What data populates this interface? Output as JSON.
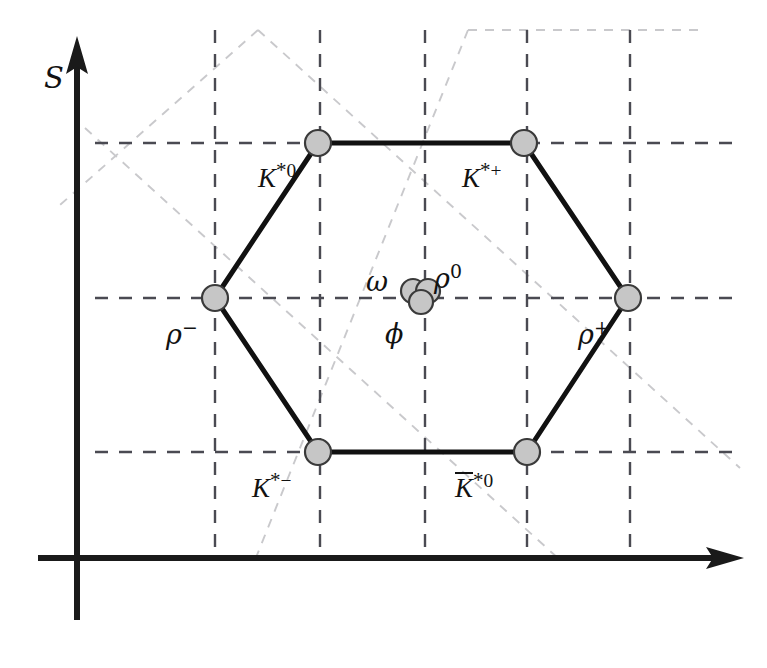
{
  "figure": {
    "background_color": "#ffffff",
    "width": 767,
    "height": 668
  },
  "axes": {
    "vertical": {
      "label": "S",
      "label_meaning": "strangeness",
      "x": 77,
      "y_top": 42,
      "y_bottom": 620,
      "color": "#1a1a1a",
      "label_x": 44,
      "label_y": 74
    },
    "horizontal": {
      "label": "",
      "y": 558,
      "x_left": 38,
      "x_right": 740,
      "color": "#1a1a1a"
    }
  },
  "grid": {
    "color": "#4a4a52",
    "diagonal_color": "#c9c9cc",
    "vertical_lines_x": [
      215,
      320,
      425,
      527,
      630
    ],
    "horizontal_lines_y": [
      143,
      298,
      452
    ],
    "vertical_span": [
      30,
      548
    ],
    "horizontal_span": [
      95,
      740
    ]
  },
  "nodes": [
    {
      "id": "Kstar0",
      "label": "K*0",
      "base": "K",
      "star": "*",
      "sup": "0",
      "overbar": false,
      "cx": 318,
      "cy": 143,
      "r": 13,
      "label_x": 258,
      "label_y": 160
    },
    {
      "id": "Kstarplus",
      "label": "K*+",
      "base": "K",
      "star": "*",
      "sup": "+",
      "overbar": false,
      "cx": 524,
      "cy": 143,
      "r": 13,
      "label_x": 462,
      "label_y": 160
    },
    {
      "id": "rhoplus",
      "label": "rho+",
      "base": "ρ",
      "star": "",
      "sup": "+",
      "overbar": false,
      "cx": 628,
      "cy": 298,
      "r": 13,
      "label_x": 578,
      "label_y": 318
    },
    {
      "id": "Kbarstar0",
      "label": "K̄*0",
      "base": "K",
      "star": "*",
      "sup": "0",
      "overbar": true,
      "cx": 527,
      "cy": 452,
      "r": 13,
      "label_x": 455,
      "label_y": 470
    },
    {
      "id": "Kstarminus",
      "label": "K*-",
      "base": "K",
      "star": "*",
      "sup": "−",
      "overbar": false,
      "cx": 318,
      "cy": 452,
      "r": 13,
      "label_x": 252,
      "label_y": 470
    },
    {
      "id": "rhominus",
      "label": "rho-",
      "base": "ρ",
      "star": "",
      "sup": "−",
      "overbar": false,
      "cx": 215,
      "cy": 298,
      "r": 13,
      "label_x": 166,
      "label_y": 318
    }
  ],
  "center_nodes": [
    {
      "id": "omega",
      "label": "ω",
      "sup": "",
      "cx": 413,
      "cy": 291,
      "r": 12,
      "label_x": 366,
      "label_y": 268
    },
    {
      "id": "rho0",
      "label": "ρ",
      "sup": "0",
      "cx": 428,
      "cy": 291,
      "r": 12,
      "label_x": 434,
      "label_y": 262
    },
    {
      "id": "phi",
      "label": "ϕ",
      "sup": "",
      "cx": 421,
      "cy": 302,
      "r": 12,
      "label_x": 385,
      "label_y": 320
    }
  ],
  "hexagon_edges": [
    {
      "from": "Kstar0",
      "to": "Kstarplus"
    },
    {
      "from": "Kstarplus",
      "to": "rhoplus"
    },
    {
      "from": "rhoplus",
      "to": "Kbarstar0"
    },
    {
      "from": "Kbarstar0",
      "to": "Kstarminus"
    },
    {
      "from": "Kstarminus",
      "to": "rhominus"
    },
    {
      "from": "rhominus",
      "to": "Kstar0"
    }
  ],
  "diagonal_guides": [
    {
      "x1": 85,
      "y1": 128,
      "x2": 560,
      "y2": 560
    },
    {
      "x1": 258,
      "y1": 30,
      "x2": 740,
      "y2": 468
    },
    {
      "x1": 258,
      "y1": 30,
      "x2": 60,
      "y2": 205
    },
    {
      "x1": 468,
      "y1": 30,
      "x2": 255,
      "y2": 560
    },
    {
      "x1": 468,
      "y1": 30,
      "x2": 700,
      "y2": 30
    }
  ],
  "colors": {
    "node_fill": "#c6c6c6",
    "node_stroke": "#3a3a3a",
    "hex_edge": "#111111",
    "grid_dash": "#4a4a52",
    "diagonal_dash": "#c9c9cc",
    "axis": "#1a1a1a",
    "text": "#121212"
  },
  "chart_data": {
    "type": "scatter",
    "xlabel": "",
    "ylabel": "S",
    "grid": true,
    "legend": "none",
    "axis_quantities": {
      "x": "I3 (third component of isospin)",
      "y": "S (strangeness)"
    },
    "categories": [
      "K*0",
      "K*+",
      "rho+",
      "K-bar*0",
      "K*-",
      "rho-",
      "omega",
      "rho0",
      "phi"
    ],
    "points": [
      {
        "label": "K*0",
        "x": -0.5,
        "y": 1,
        "px": 318,
        "py": 143
      },
      {
        "label": "K*+",
        "x": 0.5,
        "y": 1,
        "px": 524,
        "py": 143
      },
      {
        "label": "rho+",
        "x": 1.0,
        "y": 0,
        "px": 628,
        "py": 298
      },
      {
        "label": "K-bar*0",
        "x": 0.5,
        "y": -1,
        "px": 527,
        "py": 452
      },
      {
        "label": "K*-",
        "x": -0.5,
        "y": -1,
        "px": 318,
        "py": 452
      },
      {
        "label": "rho-",
        "x": -1.0,
        "y": 0,
        "px": 215,
        "py": 298
      },
      {
        "label": "omega",
        "x": 0.0,
        "y": 0,
        "px": 413,
        "py": 291
      },
      {
        "label": "rho0",
        "x": 0.0,
        "y": 0,
        "px": 428,
        "py": 291
      },
      {
        "label": "phi",
        "x": 0.0,
        "y": 0,
        "px": 421,
        "py": 302
      }
    ],
    "xlim": [
      -1.5,
      1.5
    ],
    "ylim": [
      -1.5,
      1.5
    ]
  }
}
